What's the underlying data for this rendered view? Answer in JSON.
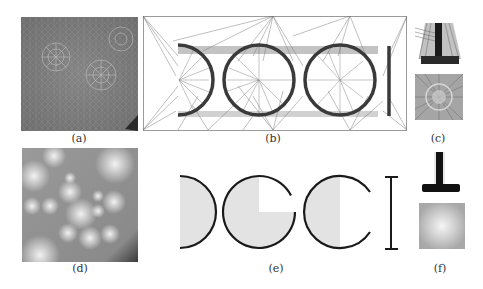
{
  "figure": {
    "panels": [
      {
        "id": "a",
        "label": "(a)",
        "description": "mesh triangulation over noisy texture with radial clusters"
      },
      {
        "id": "b",
        "label": "(b)",
        "description": "triangulated wireframe of the letters D, G, C, I"
      },
      {
        "id": "c",
        "label": "(c)",
        "description": "close-up mesh crops: T-junction and radial cluster"
      },
      {
        "id": "d",
        "label": "(d)",
        "description": "smooth grayscale blob field"
      },
      {
        "id": "e",
        "label": "(e)",
        "description": "vector shapes D, G, C, I with gray fill"
      },
      {
        "id": "f",
        "label": "(f)",
        "description": "reconstructed T-junction and soft radial blob"
      }
    ],
    "colors": {
      "background": "#ffffff",
      "stroke": "#1a1a1a",
      "fill_light": "#e3e3e3",
      "mesh_dark": "#555555",
      "mesh_mid": "#8a8a8a"
    }
  }
}
